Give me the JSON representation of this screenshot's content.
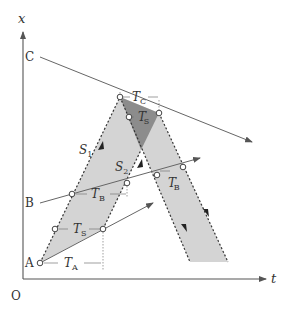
{
  "diagram": {
    "type": "spacetime-diagram",
    "axes": {
      "vertical_label": "x",
      "horizontal_label": "t",
      "origin_label": "O"
    },
    "points": {
      "A": "A",
      "B": "B",
      "C": "C"
    },
    "labels": {
      "S1": {
        "main": "S",
        "sub": "1"
      },
      "S2": {
        "main": "S",
        "sub": "2"
      },
      "TA": {
        "main": "T",
        "sub": "A"
      },
      "TB": {
        "main": "T",
        "sub": "B"
      },
      "TB_prime": {
        "main": "T",
        "sub": "B",
        "sup": "′"
      },
      "TC": {
        "main": "T",
        "sub": "C"
      },
      "TS": {
        "main": "T",
        "sub": "S"
      },
      "TS_prime": {
        "main": "T",
        "sub": "S",
        "sup": "′"
      }
    },
    "colors": {
      "axis": "#555555",
      "band_fill": "#d4d4d4",
      "overlap_fill": "#8c8c8c",
      "line": "#666666",
      "dotted_edge": "#333333"
    }
  }
}
